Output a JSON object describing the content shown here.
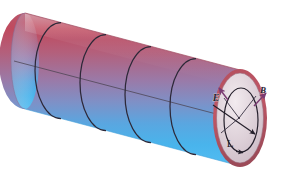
{
  "figure": {
    "type": "3d-cylinder-diagram",
    "background_color": "#ffffff",
    "canvas": {
      "width": 290,
      "height": 177
    }
  },
  "cylinder": {
    "name": "cylinder-body",
    "surface_gradient": {
      "top_color": "#c3485c",
      "upper_mid_color": "#b06a86",
      "mid_color": "#8a85b8",
      "lower_mid_color": "#4fa9e2",
      "bottom_color": "#49b6ee"
    },
    "outline_color": "#8e4a5a",
    "axis_line_color": "#4a4250",
    "ring_color": "#2d2838",
    "ring_count": 4,
    "ring_positions": [
      0.2,
      0.4,
      0.6,
      0.8
    ],
    "tilt_degrees": -12
  },
  "end_cap": {
    "name": "end-cap-disc",
    "fill_color": "#d9ccd3",
    "highlight_color": "#efe7ec",
    "rim_color": "#a8505f",
    "inner_circle_color": "#2b2533",
    "center_label": ""
  },
  "vectors": {
    "arrow_color": "#7a3b72",
    "radius_arrow_color": "#2b2533",
    "items": [
      {
        "name": "E-field-arrow",
        "label": "E",
        "label_x": 220,
        "label_y": 100,
        "direction": "up-left"
      },
      {
        "name": "B-field-arrow",
        "label": "B",
        "label_x": 262,
        "label_y": 93,
        "direction": "up-right"
      },
      {
        "name": "L-loop-label",
        "label": "L",
        "label_x": 230,
        "label_y": 147,
        "direction": "loop"
      }
    ]
  },
  "labels": {
    "E": "E",
    "B": "B",
    "L": "L"
  }
}
